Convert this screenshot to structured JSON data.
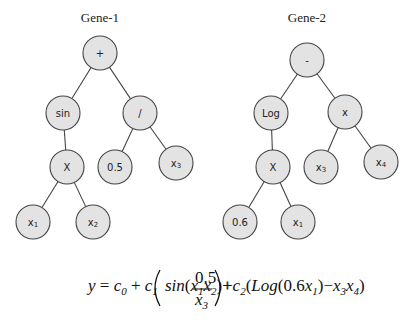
{
  "genes": [
    {
      "title": "Gene-1",
      "nodes": [
        {
          "id": "g1-root",
          "label": "+",
          "x": 100,
          "y": 53
        },
        {
          "id": "g1-sin",
          "label": "sin",
          "x": 63,
          "y": 113
        },
        {
          "id": "g1-div",
          "label": "/",
          "x": 140,
          "y": 113
        },
        {
          "id": "g1-mul",
          "label": "X",
          "x": 67,
          "y": 167
        },
        {
          "id": "g1-c05",
          "label": "0.5",
          "x": 115,
          "y": 167
        },
        {
          "id": "g1-x3",
          "label": "x",
          "sub": "3",
          "x": 176,
          "y": 163
        },
        {
          "id": "g1-x1",
          "label": "x",
          "sub": "1",
          "x": 33,
          "y": 222
        },
        {
          "id": "g1-x2",
          "label": "x",
          "sub": "2",
          "x": 93,
          "y": 222
        }
      ],
      "edges": [
        [
          "g1-root",
          "g1-sin"
        ],
        [
          "g1-root",
          "g1-div"
        ],
        [
          "g1-sin",
          "g1-mul"
        ],
        [
          "g1-div",
          "g1-c05"
        ],
        [
          "g1-div",
          "g1-x3"
        ],
        [
          "g1-mul",
          "g1-x1"
        ],
        [
          "g1-mul",
          "g1-x2"
        ]
      ]
    },
    {
      "title": "Gene-2",
      "nodes": [
        {
          "id": "g2-root",
          "label": "-",
          "x": 307,
          "y": 60
        },
        {
          "id": "g2-log",
          "label": "Log",
          "x": 271,
          "y": 113
        },
        {
          "id": "g2-mul",
          "label": "x",
          "x": 345,
          "y": 112
        },
        {
          "id": "g2-X",
          "label": "X",
          "x": 273,
          "y": 167
        },
        {
          "id": "g2-x3",
          "label": "x",
          "sub": "3",
          "x": 321,
          "y": 167
        },
        {
          "id": "g2-x4",
          "label": "x",
          "sub": "4",
          "x": 381,
          "y": 162
        },
        {
          "id": "g2-c06",
          "label": "0.6",
          "x": 240,
          "y": 222
        },
        {
          "id": "g2-x1",
          "label": "x",
          "sub": "1",
          "x": 298,
          "y": 222
        }
      ],
      "edges": [
        [
          "g2-root",
          "g2-log"
        ],
        [
          "g2-root",
          "g2-mul"
        ],
        [
          "g2-log",
          "g2-X"
        ],
        [
          "g2-mul",
          "g2-x3"
        ],
        [
          "g2-mul",
          "g2-x4"
        ],
        [
          "g2-X",
          "g2-c06"
        ],
        [
          "g2-X",
          "g2-x1"
        ]
      ]
    }
  ],
  "formula": {
    "text": "y = c0 + c1 ( sin(x1 x2) + 0.5 / x3 ) + c2 ( Log(0.6 x1) − x3 x4 )"
  },
  "colors": {
    "node_fill": "#e3e3e3",
    "stroke": "#444444"
  }
}
